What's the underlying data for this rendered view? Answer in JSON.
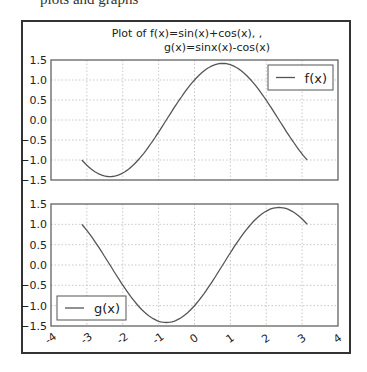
{
  "page": {
    "caption": "plots and graphs"
  },
  "chart_data": {
    "type": "line",
    "title": "Plot of f(x)=sin(x)+cos(x), ,\n g(x)=sinx(x)-cos(x)",
    "title_lines": [
      "Plot of f(x)=sin(x)+cos(x), ,",
      "g(x)=sinx(x)-cos(x)"
    ],
    "subplots": [
      {
        "name": "f(x)",
        "formula": "sin(x)+cos(x)",
        "xlim": [
          -4,
          4
        ],
        "ylim": [
          -1.5,
          1.5
        ],
        "yticks": [
          "1.5",
          "1.0",
          "0.5",
          "0.0",
          "−0.5",
          "−1.0",
          "−1.5"
        ],
        "grid": true,
        "legend": {
          "label": "f(x)",
          "position": "upper right"
        },
        "x_domain": [
          -3.14159,
          3.14159
        ],
        "line_color": "#555555"
      },
      {
        "name": "g(x)",
        "formula": "sin(x)-cos(x)",
        "xlim": [
          -4,
          4
        ],
        "ylim": [
          -1.5,
          1.5
        ],
        "yticks": [
          "1.5",
          "1.0",
          "0.5",
          "0.0",
          "−0.5",
          "−1.0",
          "−1.5"
        ],
        "xticks": [
          "-4",
          "-3",
          "-2",
          "-1",
          "0",
          "1",
          "2",
          "3",
          "4"
        ],
        "grid": true,
        "legend": {
          "label": "g(x)",
          "position": "lower left"
        },
        "x_domain": [
          -3.14159,
          3.14159
        ],
        "line_color": "#555555"
      }
    ],
    "sample_points": {
      "x": [
        -3.14,
        -2.36,
        -1.57,
        -0.79,
        0,
        0.79,
        1.57,
        2.36,
        3.14
      ],
      "f": [
        -1.0,
        -1.41,
        -1.0,
        0.0,
        1.0,
        1.41,
        1.0,
        0.0,
        -1.0
      ],
      "g": [
        1.0,
        0.0,
        -1.0,
        -1.41,
        -1.0,
        0.0,
        1.0,
        1.41,
        1.0
      ]
    }
  }
}
